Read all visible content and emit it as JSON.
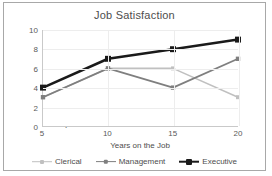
{
  "chart_data": {
    "type": "line",
    "title": "Job Satisfaction",
    "xlabel": "Years on the Job",
    "ylabel": "Job Satisfaction 1-10 Scale",
    "x": [
      5,
      10,
      15,
      20
    ],
    "xticklabels": [
      "5",
      "10",
      "15",
      "20"
    ],
    "yticklabels": [
      "0",
      "2",
      "4",
      "6",
      "8",
      "10"
    ],
    "yticks": [
      0,
      2,
      4,
      6,
      8,
      10
    ],
    "xlim": [
      5,
      20
    ],
    "ylim": [
      0,
      10
    ],
    "grid": true,
    "legend_position": "bottom",
    "series": [
      {
        "name": "Clerical",
        "values": [
          3,
          6,
          6,
          3
        ],
        "color": "#c0c0c0",
        "width": 1.6,
        "marker": "square"
      },
      {
        "name": "Management",
        "values": [
          3,
          6,
          4,
          7
        ],
        "color": "#7f7f7f",
        "width": 1.8,
        "marker": "square"
      },
      {
        "name": "Executive",
        "values": [
          4,
          7,
          8,
          9
        ],
        "color": "#1a1a1a",
        "width": 2.6,
        "marker": "square"
      }
    ]
  },
  "colors": {
    "frame_border": "#a8a8a8",
    "axis": "#c9c9c9",
    "grid": "#ededed",
    "text": "#4d4d4d",
    "tick_text": "#595959",
    "plot_background": "#ffffff"
  }
}
